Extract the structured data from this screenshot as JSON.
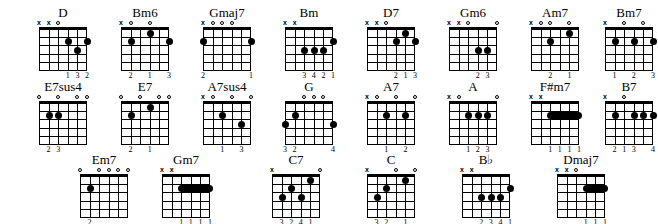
{
  "chart_data": {
    "type": "table",
    "strings": 6,
    "frets": 5,
    "symbols": {
      "muted": "x",
      "open": "o"
    },
    "rows": [
      {
        "row": 1,
        "chords": [
          {
            "name": "D",
            "x": 22,
            "y": 6,
            "topMarkers": [
              "x",
              "x",
              "o",
              "",
              "",
              ""
            ],
            "dots": [
              {
                "string": 3,
                "fret": 2
              },
              {
                "string": 2,
                "fret": 3
              },
              {
                "string": 1,
                "fret": 2
              }
            ],
            "barres": [],
            "fingers": [
              {
                "string": 3,
                "num": "1"
              },
              {
                "string": 2,
                "num": "3"
              },
              {
                "string": 1,
                "num": "2"
              }
            ]
          },
          {
            "name": "Bm6",
            "x": 104,
            "y": 6,
            "topMarkers": [
              "x",
              "o",
              "",
              "o",
              "",
              ""
            ],
            "dots": [
              {
                "string": 5,
                "fret": 2
              },
              {
                "string": 3,
                "fret": 1
              },
              {
                "string": 1,
                "fret": 2
              }
            ],
            "barres": [],
            "fingers": [
              {
                "string": 5,
                "num": "2"
              },
              {
                "string": 3,
                "num": "1"
              },
              {
                "string": 1,
                "num": "3"
              }
            ]
          },
          {
            "name": "Gmaj7",
            "x": 186,
            "y": 6,
            "topMarkers": [
              "x",
              "o",
              "o",
              "o",
              "",
              ""
            ],
            "dots": [
              {
                "string": 6,
                "fret": 2
              },
              {
                "string": 1,
                "fret": 2
              }
            ],
            "barres": [],
            "fingers": [
              {
                "string": 6,
                "num": "2"
              },
              {
                "string": 1,
                "num": "1"
              }
            ]
          },
          {
            "name": "Bm",
            "x": 268,
            "y": 6,
            "topMarkers": [
              "x",
              "x",
              "",
              "",
              "",
              ""
            ],
            "dots": [
              {
                "string": 4,
                "fret": 3
              },
              {
                "string": 3,
                "fret": 3
              },
              {
                "string": 2,
                "fret": 3
              },
              {
                "string": 1,
                "fret": 2
              }
            ],
            "barres": [],
            "fingers": [
              {
                "string": 4,
                "num": "3"
              },
              {
                "string": 3,
                "num": "4"
              },
              {
                "string": 2,
                "num": "2"
              },
              {
                "string": 1,
                "num": "1"
              }
            ]
          },
          {
            "name": "D7",
            "x": 350,
            "y": 6,
            "topMarkers": [
              "x",
              "x",
              "o",
              "",
              "",
              ""
            ],
            "dots": [
              {
                "string": 3,
                "fret": 2
              },
              {
                "string": 2,
                "fret": 1
              },
              {
                "string": 1,
                "fret": 2
              }
            ],
            "barres": [],
            "fingers": [
              {
                "string": 3,
                "num": "2"
              },
              {
                "string": 2,
                "num": "1"
              },
              {
                "string": 1,
                "num": "3"
              }
            ]
          },
          {
            "name": "Gm6",
            "x": 432,
            "y": 6,
            "topMarkers": [
              "x",
              "x",
              "o",
              "",
              "",
              "o"
            ],
            "dots": [
              {
                "string": 3,
                "fret": 3
              },
              {
                "string": 2,
                "fret": 3
              }
            ],
            "barres": [],
            "fingers": [
              {
                "string": 3,
                "num": "2"
              },
              {
                "string": 2,
                "num": "3"
              }
            ]
          },
          {
            "name": "Am7",
            "x": 514,
            "y": 6,
            "topMarkers": [
              "x",
              "o",
              "o",
              "",
              "o",
              ""
            ],
            "dots": [
              {
                "string": 4,
                "fret": 2
              },
              {
                "string": 2,
                "fret": 1
              }
            ],
            "barres": [],
            "fingers": [
              {
                "string": 4,
                "num": "2"
              },
              {
                "string": 2,
                "num": "1"
              }
            ]
          },
          {
            "name": "Bm7",
            "x": 588,
            "y": 6,
            "topMarkers": [
              "x",
              "",
              "o",
              "",
              "o",
              ""
            ],
            "dots": [
              {
                "string": 5,
                "fret": 2
              },
              {
                "string": 3,
                "fret": 2
              },
              {
                "string": 1,
                "fret": 2
              }
            ],
            "barres": [],
            "fingers": [
              {
                "string": 5,
                "num": "1"
              },
              {
                "string": 3,
                "num": "2"
              },
              {
                "string": 1,
                "num": "3"
              }
            ]
          }
        ]
      },
      {
        "row": 2,
        "chords": [
          {
            "name": "E7sus4",
            "x": 22,
            "y": 80,
            "topMarkers": [
              "o",
              "",
              "o",
              "",
              "o",
              "o"
            ],
            "dots": [
              {
                "string": 5,
                "fret": 2
              },
              {
                "string": 4,
                "fret": 2
              }
            ],
            "barres": [],
            "fingers": [
              {
                "string": 5,
                "num": "2"
              },
              {
                "string": 4,
                "num": "3"
              }
            ]
          },
          {
            "name": "E7",
            "x": 104,
            "y": 80,
            "topMarkers": [
              "o",
              "",
              "o",
              "",
              "o",
              "o"
            ],
            "dots": [
              {
                "string": 5,
                "fret": 2
              },
              {
                "string": 3,
                "fret": 1
              }
            ],
            "barres": [],
            "fingers": [
              {
                "string": 5,
                "num": "2"
              },
              {
                "string": 3,
                "num": "1"
              }
            ]
          },
          {
            "name": "A7sus4",
            "x": 186,
            "y": 80,
            "topMarkers": [
              "x",
              "o",
              "",
              "o",
              "",
              "o"
            ],
            "dots": [
              {
                "string": 4,
                "fret": 2
              },
              {
                "string": 2,
                "fret": 3
              }
            ],
            "barres": [],
            "fingers": [
              {
                "string": 4,
                "num": "1"
              },
              {
                "string": 2,
                "num": "3"
              }
            ]
          },
          {
            "name": "G",
            "x": 268,
            "y": 80,
            "topMarkers": [
              "",
              "",
              "o",
              "o",
              "o",
              ""
            ],
            "dots": [
              {
                "string": 6,
                "fret": 3
              },
              {
                "string": 5,
                "fret": 2
              },
              {
                "string": 1,
                "fret": 3
              }
            ],
            "barres": [],
            "fingers": [
              {
                "string": 6,
                "num": "3"
              },
              {
                "string": 5,
                "num": "2"
              },
              {
                "string": 1,
                "num": "4"
              }
            ]
          },
          {
            "name": "A7",
            "x": 350,
            "y": 80,
            "topMarkers": [
              "x",
              "o",
              "",
              "o",
              "",
              "o"
            ],
            "dots": [
              {
                "string": 4,
                "fret": 2
              },
              {
                "string": 2,
                "fret": 2
              }
            ],
            "barres": [],
            "fingers": [
              {
                "string": 4,
                "num": "1"
              },
              {
                "string": 2,
                "num": "2"
              }
            ]
          },
          {
            "name": "A",
            "x": 432,
            "y": 80,
            "topMarkers": [
              "x",
              "o",
              "",
              "",
              "",
              "o"
            ],
            "dots": [
              {
                "string": 4,
                "fret": 2
              },
              {
                "string": 3,
                "fret": 2
              },
              {
                "string": 2,
                "fret": 2
              }
            ],
            "barres": [],
            "fingers": [
              {
                "string": 4,
                "num": "1"
              },
              {
                "string": 3,
                "num": "2"
              },
              {
                "string": 2,
                "num": "3"
              }
            ]
          },
          {
            "name": "F#m7",
            "x": 514,
            "y": 80,
            "topMarkers": [
              "x",
              "x",
              "",
              "",
              "",
              ""
            ],
            "dots": [],
            "barres": [
              {
                "fret": 2,
                "from": 4,
                "to": 1
              }
            ],
            "fingers": [
              {
                "string": 4,
                "num": "1"
              },
              {
                "string": 3,
                "num": "1"
              },
              {
                "string": 2,
                "num": "1"
              },
              {
                "string": 1,
                "num": "1"
              }
            ]
          },
          {
            "name": "B7",
            "x": 588,
            "y": 80,
            "topMarkers": [
              "x",
              "",
              "o",
              "",
              "",
              ""
            ],
            "dots": [
              {
                "string": 5,
                "fret": 2
              },
              {
                "string": 3,
                "fret": 2
              },
              {
                "string": 2,
                "fret": 2
              },
              {
                "string": 1,
                "fret": 2
              }
            ],
            "barres": [],
            "fingers": [
              {
                "string": 5,
                "num": "2"
              },
              {
                "string": 4,
                "num": "1"
              },
              {
                "string": 3,
                "num": "3"
              },
              {
                "string": 1,
                "num": "4"
              }
            ]
          }
        ]
      },
      {
        "row": 3,
        "chords": [
          {
            "name": "Em7",
            "x": 63,
            "y": 153,
            "topMarkers": [
              "o",
              "",
              "o",
              "o",
              "o",
              "o"
            ],
            "dots": [
              {
                "string": 5,
                "fret": 2
              }
            ],
            "barres": [],
            "fingers": [
              {
                "string": 5,
                "num": "2"
              }
            ]
          },
          {
            "name": "Gm7",
            "x": 145,
            "y": 153,
            "topMarkers": [
              "x",
              "x",
              "",
              "",
              "",
              ""
            ],
            "dots": [],
            "barres": [
              {
                "fret": 2,
                "from": 4,
                "to": 1
              }
            ],
            "fingers": [
              {
                "string": 4,
                "num": "1"
              },
              {
                "string": 3,
                "num": "1"
              },
              {
                "string": 2,
                "num": "1"
              },
              {
                "string": 1,
                "num": "1"
              }
            ]
          },
          {
            "name": "C7",
            "x": 255,
            "y": 153,
            "topMarkers": [
              "x",
              "",
              "",
              "",
              "",
              "o"
            ],
            "dots": [
              {
                "string": 5,
                "fret": 3
              },
              {
                "string": 4,
                "fret": 2
              },
              {
                "string": 3,
                "fret": 3
              },
              {
                "string": 2,
                "fret": 1
              }
            ],
            "barres": [],
            "fingers": [
              {
                "string": 5,
                "num": "3"
              },
              {
                "string": 4,
                "num": "2"
              },
              {
                "string": 3,
                "num": "4"
              },
              {
                "string": 2,
                "num": "1"
              }
            ]
          },
          {
            "name": "C",
            "x": 350,
            "y": 153,
            "topMarkers": [
              "x",
              "",
              "",
              "o",
              "",
              "o"
            ],
            "dots": [
              {
                "string": 5,
                "fret": 3
              },
              {
                "string": 4,
                "fret": 2
              },
              {
                "string": 2,
                "fret": 1
              }
            ],
            "barres": [],
            "fingers": [
              {
                "string": 5,
                "num": "3"
              },
              {
                "string": 4,
                "num": "2"
              },
              {
                "string": 2,
                "num": "1"
              }
            ]
          },
          {
            "name": "B♭",
            "x": 445,
            "y": 153,
            "topMarkers": [
              "x",
              "x",
              "",
              "",
              "",
              ""
            ],
            "dots": [
              {
                "string": 4,
                "fret": 3
              },
              {
                "string": 3,
                "fret": 3
              },
              {
                "string": 2,
                "fret": 3
              },
              {
                "string": 1,
                "fret": 2
              }
            ],
            "barres": [],
            "fingers": [
              {
                "string": 4,
                "num": "2"
              },
              {
                "string": 3,
                "num": "3"
              },
              {
                "string": 2,
                "num": "4"
              },
              {
                "string": 1,
                "num": "1"
              }
            ]
          },
          {
            "name": "Dmaj7",
            "x": 540,
            "y": 153,
            "topMarkers": [
              "x",
              "x",
              "o",
              "",
              "",
              ""
            ],
            "dots": [],
            "barres": [
              {
                "fret": 2,
                "from": 3,
                "to": 1
              }
            ],
            "fingers": [
              {
                "string": 3,
                "num": "1"
              },
              {
                "string": 2,
                "num": "1"
              },
              {
                "string": 1,
                "num": "1"
              }
            ]
          }
        ]
      }
    ]
  }
}
